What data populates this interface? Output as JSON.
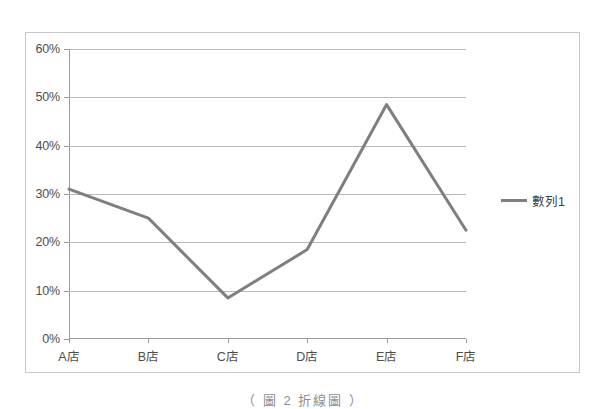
{
  "chart_data": {
    "type": "line",
    "title": "",
    "xlabel": "",
    "ylabel": "",
    "categories": [
      "A店",
      "B店",
      "C店",
      "D店",
      "E店",
      "F店"
    ],
    "series": [
      {
        "name": "數列1",
        "values": [
          31,
          25,
          8.5,
          18.5,
          48.5,
          22.5
        ],
        "color": "#7f7f7f"
      }
    ],
    "ylim": [
      0,
      60
    ],
    "ytick_values": [
      0,
      10,
      20,
      30,
      40,
      50,
      60
    ],
    "ytick_labels": [
      "0%",
      "10%",
      "20%",
      "30%",
      "40%",
      "50%",
      "60%"
    ],
    "grid": true,
    "legend_position": "right",
    "legend_entries": [
      "數列1"
    ]
  },
  "caption": {
    "text": "（ 圖 2 折線圖 ）"
  }
}
